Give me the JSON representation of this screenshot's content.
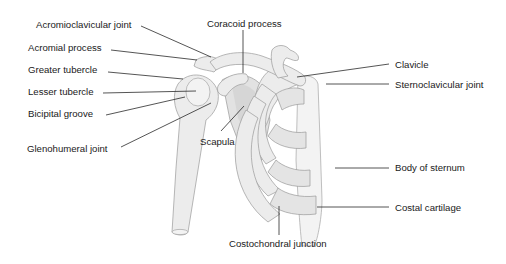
{
  "diagram": {
    "labels": {
      "acromioclavicular_joint": "Acromioclavicular joint",
      "coracoid_process": "Coracoid process",
      "acromial_process": "Acromial process",
      "greater_tubercle": "Greater tubercle",
      "lesser_tubercle": "Lesser tubercle",
      "bicipital_groove": "Bicipital groove",
      "glenohumeral_joint": "Glenohumeral joint",
      "scapula": "Scapula",
      "clavicle": "Clavicle",
      "sternoclavicular_joint": "Sternoclavicular joint",
      "body_of_sternum": "Body of sternum",
      "costal_cartilage": "Costal cartilage",
      "costochondral_junction": "Costochondral junction"
    },
    "colors": {
      "background": "#ffffff",
      "bone": "#ececec",
      "outline": "#9a9a9a",
      "label_text": "#1a1a1a",
      "leader_line": "#2a2a2a"
    }
  }
}
